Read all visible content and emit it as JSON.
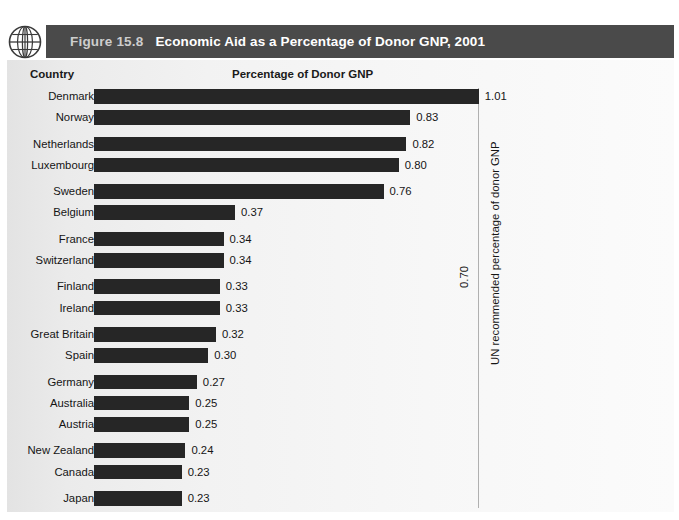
{
  "header": {
    "figure_number": "Figure 15.8",
    "title": "Economic Aid as a Percentage of Donor GNP, 2001",
    "icon": "globe-icon",
    "band_color": "#4a4a4a"
  },
  "columns": {
    "country": "Country",
    "value": "Percentage of Donor GNP"
  },
  "reference": {
    "value_label": "0.70",
    "caption": "UN recommended percentage of donor GNP",
    "value": 0.7,
    "line_color": "#b0b0b0"
  },
  "chart_data": {
    "type": "bar",
    "orientation": "horizontal",
    "title": "Economic Aid as a Percentage of Donor GNP, 2001",
    "xlabel": "Percentage of Donor GNP",
    "ylabel": "Country",
    "xlim": [
      0,
      1.05
    ],
    "grid": false,
    "legend": "none",
    "bar_color": "#262626",
    "categories": [
      "Denmark",
      "Norway",
      "Netherlands",
      "Luxembourg",
      "Sweden",
      "Belgium",
      "France",
      "Switzerland",
      "Finland",
      "Ireland",
      "Great Britain",
      "Spain",
      "Germany",
      "Australia",
      "Austria",
      "New Zealand",
      "Canada",
      "Japan",
      "Greece",
      "Italy",
      "United States",
      "Average"
    ],
    "values": [
      1.01,
      0.83,
      0.82,
      0.8,
      0.76,
      0.37,
      0.34,
      0.34,
      0.33,
      0.33,
      0.32,
      0.3,
      0.27,
      0.25,
      0.25,
      0.24,
      0.23,
      0.23,
      0.19,
      0.14,
      0.11,
      0.22
    ],
    "value_labels": [
      "1.01",
      "0.83",
      "0.82",
      "0.80",
      "0.76",
      "0.37",
      "0.34",
      "0.34",
      "0.33",
      "0.33",
      "0.32",
      "0.30",
      "0.27",
      "0.25",
      "0.25",
      "0.24",
      "0.23",
      "0.23",
      "0.19",
      "0.14",
      "0.11",
      "0.22"
    ],
    "annotations": [
      {
        "type": "vline",
        "x": 0.7,
        "label": "0.70",
        "caption": "UN recommended percentage of donor GNP"
      }
    ]
  },
  "rows": [
    {
      "label": "Denmark",
      "value": 1.01,
      "value_label": "1.01",
      "gap_above": false
    },
    {
      "label": "Norway",
      "value": 0.83,
      "value_label": "0.83",
      "gap_above": false
    },
    {
      "label": "Netherlands",
      "value": 0.82,
      "value_label": "0.82",
      "gap_above": true
    },
    {
      "label": "Luxembourg",
      "value": 0.8,
      "value_label": "0.80",
      "gap_above": false
    },
    {
      "label": "Sweden",
      "value": 0.76,
      "value_label": "0.76",
      "gap_above": true
    },
    {
      "label": "Belgium",
      "value": 0.37,
      "value_label": "0.37",
      "gap_above": false
    },
    {
      "label": "France",
      "value": 0.34,
      "value_label": "0.34",
      "gap_above": true
    },
    {
      "label": "Switzerland",
      "value": 0.34,
      "value_label": "0.34",
      "gap_above": false
    },
    {
      "label": "Finland",
      "value": 0.33,
      "value_label": "0.33",
      "gap_above": true
    },
    {
      "label": "Ireland",
      "value": 0.33,
      "value_label": "0.33",
      "gap_above": false
    },
    {
      "label": "Great Britain",
      "value": 0.32,
      "value_label": "0.32",
      "gap_above": true
    },
    {
      "label": "Spain",
      "value": 0.3,
      "value_label": "0.30",
      "gap_above": false
    },
    {
      "label": "Germany",
      "value": 0.27,
      "value_label": "0.27",
      "gap_above": true
    },
    {
      "label": "Australia",
      "value": 0.25,
      "value_label": "0.25",
      "gap_above": false
    },
    {
      "label": "Austria",
      "value": 0.25,
      "value_label": "0.25",
      "gap_above": false
    },
    {
      "label": "New Zealand",
      "value": 0.24,
      "value_label": "0.24",
      "gap_above": true
    },
    {
      "label": "Canada",
      "value": 0.23,
      "value_label": "0.23",
      "gap_above": false
    },
    {
      "label": "Japan",
      "value": 0.23,
      "value_label": "0.23",
      "gap_above": true
    },
    {
      "label": "Greece",
      "value": 0.19,
      "value_label": "0.19",
      "gap_above": false
    },
    {
      "label": "Italy",
      "value": 0.14,
      "value_label": "0.14",
      "gap_above": true
    },
    {
      "label": "United States",
      "value": 0.11,
      "value_label": "0.11",
      "gap_above": false
    },
    {
      "label": "Average",
      "value": 0.22,
      "value_label": "0.22",
      "gap_above": true
    }
  ]
}
